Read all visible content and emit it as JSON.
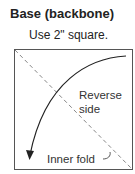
{
  "diagram": {
    "title": "Base (backbone)",
    "instruction": "Use 2\" square.",
    "labels": {
      "reverse_line1": "Reverse",
      "reverse_line2": "side",
      "inner_fold": "Inner fold"
    },
    "colors": {
      "stroke": "#333333",
      "dashed": "#888888",
      "background": "#ffffff"
    }
  }
}
